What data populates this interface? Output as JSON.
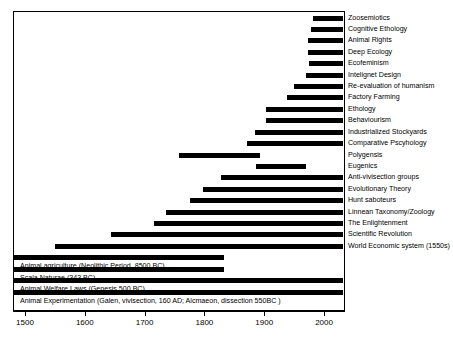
{
  "chart_data": {
    "type": "bar",
    "orientation": "horizontal",
    "title": "",
    "subtitle": "",
    "xlabel": "",
    "ylabel": "",
    "xlim": [
      1480,
      2035
    ],
    "xticks": [
      1500,
      1600,
      1700,
      1800,
      1900,
      2000
    ],
    "xtick_labels": [
      "1500",
      "1600",
      "1700",
      "1800",
      "1900",
      "2000"
    ],
    "grid": false,
    "legend": null,
    "bar_color": "#000000",
    "background_color": "#ffffff",
    "frame_color": "#000000",
    "note": "Horizontal timeline (Gantt-style) of ideas and practices concerning animals; each bar spans its start year to the present edge of the axis.",
    "categories": [
      "Zoosemiotics",
      "Cognitive Ethology",
      "Animal Rights",
      "Deep Ecology",
      "Ecofeminism",
      "Intelignet Design",
      "Re-evaluation of humanism",
      "Factory Farming",
      "Ethology",
      "Behaviourism",
      "Industrialized Stockyards",
      "Comparative Pscyhology",
      "Polygensis",
      "Eugenics",
      "Anti-vivisection groups",
      "Evolutionary Theory",
      "Hunt saboteurs",
      "Linnean Taxonomy/Zoology",
      "The Enlightenment",
      "Scientific Revolution",
      "World Economic system (1550s)",
      "Animal agriculture (Neolithic Period, 8500 BC)",
      "Scala Naturae (343 BC)",
      "Animal Welfare Laws (Genesis 500 BC)",
      "Animal Experimentation (Galen, vivisection, 160 AD; Alcmaeon, dissection 550BC )"
    ],
    "bars": [
      {
        "label": "Zoosemiotics",
        "start": 1982,
        "end": 2032,
        "label_side": "right"
      },
      {
        "label": "Cognitive Ethology",
        "start": 1978,
        "end": 2032,
        "label_side": "right"
      },
      {
        "label": "Animal Rights",
        "start": 1973,
        "end": 2032,
        "label_side": "right"
      },
      {
        "label": "Deep Ecology",
        "start": 1973,
        "end": 2032,
        "label_side": "right"
      },
      {
        "label": "Ecofeminism",
        "start": 1974,
        "end": 2032,
        "label_side": "right"
      },
      {
        "label": "Intelignet Design",
        "start": 1970,
        "end": 2032,
        "label_side": "right"
      },
      {
        "label": "Re-evaluation of humanism",
        "start": 1950,
        "end": 2032,
        "label_side": "right"
      },
      {
        "label": "Factory Farming",
        "start": 1938,
        "end": 2032,
        "label_side": "right"
      },
      {
        "label": "Ethology",
        "start": 1903,
        "end": 2032,
        "label_side": "right"
      },
      {
        "label": "Behaviourism",
        "start": 1903,
        "end": 2032,
        "label_side": "right"
      },
      {
        "label": "Industrialized Stockyards",
        "start": 1885,
        "end": 2032,
        "label_side": "right"
      },
      {
        "label": "Comparative Pscyhology",
        "start": 1872,
        "end": 2032,
        "label_side": "right"
      },
      {
        "label": "Polygensis",
        "start": 1757,
        "end": 1893,
        "label_side": "right"
      },
      {
        "label": "Eugenics",
        "start": 1886,
        "end": 1970,
        "label_side": "right"
      },
      {
        "label": "Anti-vivisection groups",
        "start": 1828,
        "end": 2032,
        "label_side": "right"
      },
      {
        "label": "Evolutionary Theory",
        "start": 1798,
        "end": 2032,
        "label_side": "right"
      },
      {
        "label": "Hunt saboteurs",
        "start": 1776,
        "end": 2032,
        "label_side": "right"
      },
      {
        "label": "Linnean Taxonomy/Zoology",
        "start": 1735,
        "end": 2032,
        "label_side": "right"
      },
      {
        "label": "The Enlightenment",
        "start": 1715,
        "end": 2032,
        "label_side": "right"
      },
      {
        "label": "Scientific Revolution",
        "start": 1643,
        "end": 2032,
        "label_side": "right"
      },
      {
        "label": "World Economic system (1550s)",
        "start": 1550,
        "end": 2032,
        "label_side": "right"
      },
      {
        "label": "Animal agriculture (Neolithic Period, 8500 BC)",
        "start": 1480,
        "end": 1833,
        "label_side": "inside"
      },
      {
        "label": "Scala Naturae (343 BC)",
        "start": 1480,
        "end": 1833,
        "label_side": "inside"
      },
      {
        "label": "Animal Welfare Laws (Genesis 500 BC)",
        "start": 1480,
        "end": 2032,
        "label_side": "inside"
      },
      {
        "label": "Animal Experimentation (Galen, vivisection, 160 AD; Alcmaeon, dissection 550BC )",
        "start": 1480,
        "end": 2032,
        "label_side": "inside"
      }
    ]
  }
}
